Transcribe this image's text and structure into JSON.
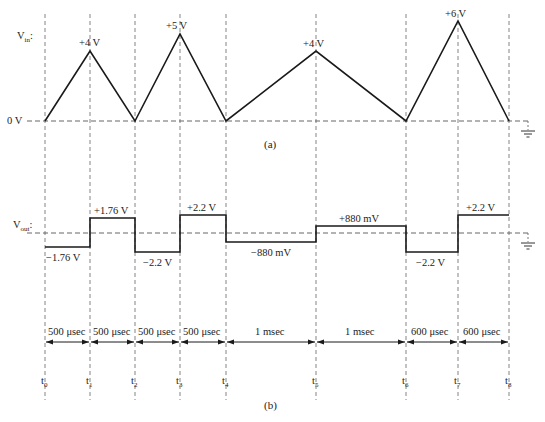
{
  "figure": {
    "part_a": {
      "caption": "(a)",
      "ylabel": "V",
      "ylabel_sub": "in",
      "ylabel_suffix": ":",
      "zero_label": "0 V",
      "peaks": [
        {
          "label": "+4 V",
          "t": "t1"
        },
        {
          "label": "+5 V",
          "t": "t3"
        },
        {
          "label": "+4 V",
          "t": "t5"
        },
        {
          "label": "+6 V",
          "t": "t7"
        }
      ]
    },
    "part_b": {
      "caption": "(b)",
      "ylabel": "V",
      "ylabel_sub": "out",
      "ylabel_suffix": ":",
      "levels": [
        {
          "label": "−1.76 V",
          "from": "t0",
          "to": "t1"
        },
        {
          "label": "+1.76 V",
          "from": "t1",
          "to": "t2"
        },
        {
          "label": "−2.2 V",
          "from": "t2",
          "to": "t3"
        },
        {
          "label": "+2.2 V",
          "from": "t3",
          "to": "t4"
        },
        {
          "label": "−880 mV",
          "from": "t4",
          "to": "t5"
        },
        {
          "label": "+880 mV",
          "from": "t5",
          "to": "t6"
        },
        {
          "label": "−2.2 V",
          "from": "t6",
          "to": "t7"
        },
        {
          "label": "+2.2 V",
          "from": "t7",
          "to": "t8"
        }
      ],
      "durations": [
        "500 μsec",
        "500 μsec",
        "500 μsec",
        "500 μsec",
        "1 msec",
        "1 msec",
        "600 μsec",
        "600 μsec"
      ]
    },
    "time_markers": [
      {
        "t": "t",
        "sub": "0"
      },
      {
        "t": "t",
        "sub": "1"
      },
      {
        "t": "t",
        "sub": "2"
      },
      {
        "t": "t",
        "sub": "3"
      },
      {
        "t": "t",
        "sub": "4"
      },
      {
        "t": "t",
        "sub": "5"
      },
      {
        "t": "t",
        "sub": "6"
      },
      {
        "t": "t",
        "sub": "7"
      },
      {
        "t": "t",
        "sub": "8"
      }
    ],
    "icons": {
      "ground_a": "ground-symbol-icon",
      "ground_b": "ground-symbol-icon"
    },
    "colors": {
      "trace": "#1a1a1a",
      "dashed": "#555555",
      "background": "#ffffff"
    }
  }
}
